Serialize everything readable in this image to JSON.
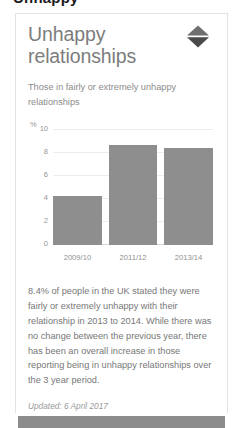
{
  "page": {
    "clipped_headline": "Unhappy"
  },
  "card": {
    "title": "Unhappy relationships",
    "subtitle": "Those in fairly or extremely unhappy relationships",
    "sort_icon": "sort-diamond-icon",
    "note": "8.4% of people in the UK stated they were fairly or extremely unhappy with their relationship in 2013 to 2014. While there was no change between the previous year, there has been an overall increase in those reporting being in unhappy relationships over the 3 year period.",
    "updated": "Updated: 6 April 2017"
  },
  "chart_data": {
    "type": "bar",
    "title": "Unhappy relationships",
    "subtitle": "Those in fairly or extremely unhappy relationships",
    "categories": [
      "2009/10",
      "2011/12",
      "2013/14"
    ],
    "values": [
      4.3,
      8.7,
      8.4
    ],
    "series": [
      {
        "name": "Fairly or extremely unhappy relationships",
        "values": [
          4.3,
          8.7,
          8.4
        ]
      }
    ],
    "xlabel": "",
    "ylabel": "%",
    "yunit": "%",
    "ylim": [
      0,
      10
    ],
    "yticks": [
      10,
      8,
      6,
      4,
      2,
      0
    ],
    "grid": true,
    "legend": "none",
    "bar_color": "#8e8e8e",
    "grid_color": "#ededed"
  }
}
